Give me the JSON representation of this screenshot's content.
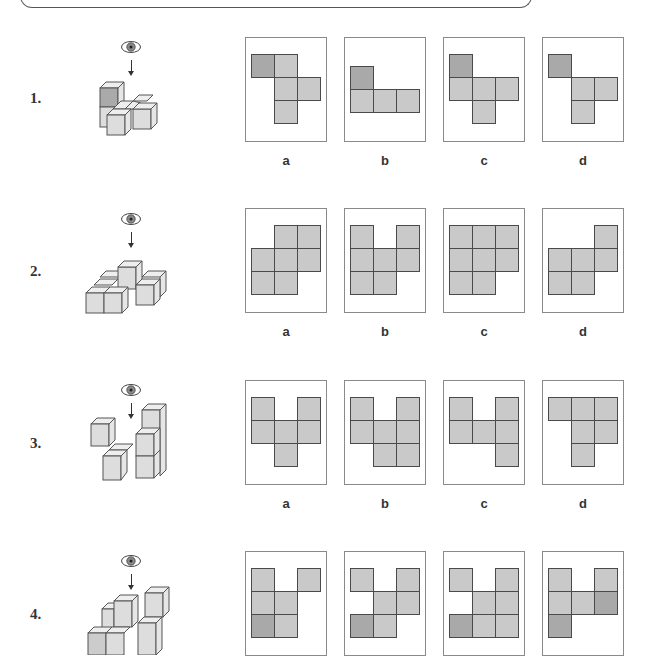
{
  "colors": {
    "light_cell": "#c9c9c9",
    "dark_cell": "#a9a9a9",
    "cell_border": "#4a4a4a",
    "box_border": "#8a8a8a"
  },
  "questions": [
    {
      "number": "1.",
      "options": [
        {
          "label": "a",
          "cells": [
            [
              0,
              0,
              "d"
            ],
            [
              1,
              0,
              "l"
            ],
            [
              1,
              1,
              "l"
            ],
            [
              2,
              1,
              "l"
            ],
            [
              1,
              2,
              "l"
            ]
          ]
        },
        {
          "label": "b",
          "cells": [
            [
              0,
              0,
              "d"
            ],
            [
              0,
              1,
              "l"
            ],
            [
              1,
              1,
              "l"
            ],
            [
              2,
              1,
              "l"
            ]
          ],
          "offset_y": 12
        },
        {
          "label": "c",
          "cells": [
            [
              0,
              0,
              "d"
            ],
            [
              0,
              1,
              "l"
            ],
            [
              1,
              1,
              "l"
            ],
            [
              2,
              1,
              "l"
            ],
            [
              1,
              2,
              "l"
            ]
          ]
        },
        {
          "label": "d",
          "cells": [
            [
              0,
              0,
              "d"
            ],
            [
              1,
              1,
              "l"
            ],
            [
              2,
              1,
              "l"
            ],
            [
              1,
              2,
              "l"
            ]
          ]
        }
      ]
    },
    {
      "number": "2.",
      "options": [
        {
          "label": "a",
          "cells": [
            [
              1,
              0,
              "l"
            ],
            [
              2,
              0,
              "l"
            ],
            [
              0,
              1,
              "l"
            ],
            [
              1,
              1,
              "l"
            ],
            [
              2,
              1,
              "l"
            ],
            [
              0,
              2,
              "l"
            ],
            [
              1,
              2,
              "l"
            ]
          ]
        },
        {
          "label": "b",
          "cells": [
            [
              0,
              0,
              "l"
            ],
            [
              2,
              0,
              "l"
            ],
            [
              0,
              1,
              "l"
            ],
            [
              1,
              1,
              "l"
            ],
            [
              2,
              1,
              "l"
            ],
            [
              0,
              2,
              "l"
            ],
            [
              1,
              2,
              "l"
            ]
          ]
        },
        {
          "label": "c",
          "cells": [
            [
              0,
              0,
              "l"
            ],
            [
              1,
              0,
              "l"
            ],
            [
              2,
              0,
              "l"
            ],
            [
              0,
              1,
              "l"
            ],
            [
              1,
              1,
              "l"
            ],
            [
              2,
              1,
              "l"
            ],
            [
              0,
              2,
              "l"
            ],
            [
              1,
              2,
              "l"
            ]
          ]
        },
        {
          "label": "d",
          "cells": [
            [
              2,
              0,
              "l"
            ],
            [
              0,
              1,
              "l"
            ],
            [
              1,
              1,
              "l"
            ],
            [
              2,
              1,
              "l"
            ],
            [
              0,
              2,
              "l"
            ],
            [
              1,
              2,
              "l"
            ]
          ]
        }
      ]
    },
    {
      "number": "3.",
      "options": [
        {
          "label": "a",
          "cells": [
            [
              0,
              0,
              "l"
            ],
            [
              2,
              0,
              "l"
            ],
            [
              0,
              1,
              "l"
            ],
            [
              1,
              1,
              "l"
            ],
            [
              2,
              1,
              "l"
            ],
            [
              1,
              2,
              "l"
            ]
          ]
        },
        {
          "label": "b",
          "cells": [
            [
              0,
              0,
              "l"
            ],
            [
              2,
              0,
              "l"
            ],
            [
              0,
              1,
              "l"
            ],
            [
              1,
              1,
              "l"
            ],
            [
              2,
              1,
              "l"
            ],
            [
              1,
              2,
              "l"
            ],
            [
              2,
              2,
              "l"
            ]
          ]
        },
        {
          "label": "c",
          "cells": [
            [
              0,
              0,
              "l"
            ],
            [
              2,
              0,
              "l"
            ],
            [
              0,
              1,
              "l"
            ],
            [
              1,
              1,
              "l"
            ],
            [
              2,
              1,
              "l"
            ],
            [
              2,
              2,
              "l"
            ]
          ]
        },
        {
          "label": "d",
          "cells": [
            [
              0,
              0,
              "l"
            ],
            [
              1,
              0,
              "l"
            ],
            [
              2,
              0,
              "l"
            ],
            [
              1,
              1,
              "l"
            ],
            [
              2,
              1,
              "l"
            ],
            [
              1,
              2,
              "l"
            ]
          ]
        }
      ]
    },
    {
      "number": "4.",
      "options": [
        {
          "label": "a",
          "cells": [
            [
              0,
              0,
              "l"
            ],
            [
              2,
              0,
              "l"
            ],
            [
              0,
              1,
              "l"
            ],
            [
              1,
              1,
              "l"
            ],
            [
              0,
              2,
              "d"
            ],
            [
              1,
              2,
              "l"
            ]
          ]
        },
        {
          "label": "b",
          "cells": [
            [
              0,
              0,
              "l"
            ],
            [
              2,
              0,
              "l"
            ],
            [
              1,
              1,
              "l"
            ],
            [
              2,
              1,
              "l"
            ],
            [
              0,
              2,
              "d"
            ],
            [
              1,
              2,
              "l"
            ]
          ]
        },
        {
          "label": "c",
          "cells": [
            [
              0,
              0,
              "l"
            ],
            [
              2,
              0,
              "l"
            ],
            [
              1,
              1,
              "l"
            ],
            [
              2,
              1,
              "l"
            ],
            [
              0,
              2,
              "d"
            ],
            [
              1,
              2,
              "l"
            ],
            [
              2,
              2,
              "l"
            ]
          ]
        },
        {
          "label": "d",
          "cells": [
            [
              0,
              0,
              "l"
            ],
            [
              2,
              0,
              "l"
            ],
            [
              0,
              1,
              "l"
            ],
            [
              1,
              1,
              "l"
            ],
            [
              2,
              1,
              "d"
            ],
            [
              0,
              2,
              "d"
            ]
          ]
        }
      ]
    }
  ]
}
